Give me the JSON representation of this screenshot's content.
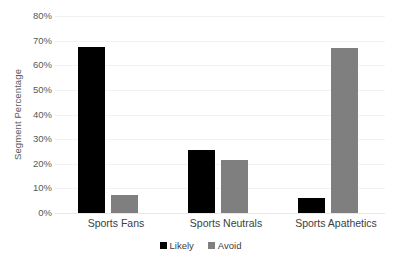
{
  "chart_data": {
    "type": "bar",
    "title": "",
    "subtitle": "",
    "xlabel": "",
    "ylabel": "Segment Percentage",
    "categories": [
      "Sports Fans",
      "Sports Neutrals",
      "Sports Apathetics"
    ],
    "series": [
      {
        "name": "Likely",
        "color": "#000000",
        "values": [
          67.5,
          25.5,
          6.0
        ]
      },
      {
        "name": "Avoid",
        "color": "#7f7f7f",
        "values": [
          7.3,
          21.5,
          67.0
        ]
      }
    ],
    "ylim": [
      0,
      80
    ],
    "ytick_values": [
      0,
      10,
      20,
      30,
      40,
      50,
      60,
      70,
      80
    ],
    "ytick_labels": [
      "0%",
      "10%",
      "20%",
      "30%",
      "40%",
      "50%",
      "60%",
      "70%",
      "80%"
    ],
    "ytick_suffix": "%",
    "grid": true,
    "grid_axis": "y",
    "grid_color": "#f2f2f2",
    "legend_position": "bottom",
    "background_color": "#ffffff",
    "axis_label_color": "#595959",
    "tick_label_color": "#595959"
  }
}
